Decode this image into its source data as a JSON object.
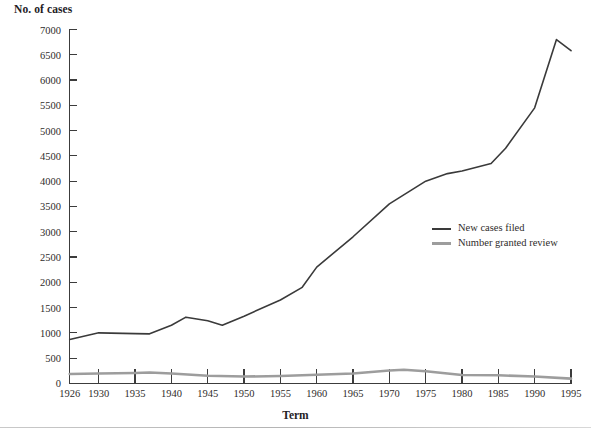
{
  "chart_data": {
    "type": "line",
    "title": "",
    "ylabel": "No. of cases",
    "xlabel": "Term",
    "grid": false,
    "legend_position": "inside-right",
    "xlim": [
      1926,
      1995
    ],
    "ylim": [
      0,
      7000
    ],
    "ytick_step": 500,
    "yticks": [
      7000,
      6500,
      6000,
      5500,
      5000,
      4500,
      4000,
      3500,
      3000,
      2500,
      2000,
      1500,
      1000,
      500,
      0
    ],
    "xticks": [
      1926,
      1930,
      1935,
      1940,
      1945,
      1950,
      1955,
      1960,
      1965,
      1970,
      1975,
      1980,
      1985,
      1990,
      1995
    ],
    "colors": {
      "series_new_cases": "#3a3a3a",
      "series_granted_review": "#9d9d9d",
      "axis": "#3c3c3c",
      "text": "#2f2c2b",
      "background": "#ffffff"
    },
    "series": [
      {
        "name": "New cases filed",
        "color": "#3a3a3a",
        "x": [
          1926,
          1930,
          1935,
          1937,
          1940,
          1942,
          1945,
          1947,
          1950,
          1955,
          1958,
          1960,
          1965,
          1970,
          1975,
          1978,
          1980,
          1984,
          1986,
          1990,
          1993,
          1995
        ],
        "values": [
          870,
          1000,
          985,
          980,
          1150,
          1310,
          1240,
          1150,
          1330,
          1650,
          1900,
          2300,
          2900,
          3550,
          4000,
          4150,
          4200,
          4350,
          4650,
          5450,
          6800,
          6580
        ]
      },
      {
        "name": "Number granted review",
        "color": "#9d9d9d",
        "x": [
          1926,
          1930,
          1935,
          1937,
          1940,
          1945,
          1950,
          1955,
          1960,
          1965,
          1970,
          1972,
          1975,
          1980,
          1985,
          1990,
          1995
        ],
        "values": [
          185,
          195,
          205,
          215,
          195,
          150,
          135,
          145,
          170,
          195,
          255,
          270,
          240,
          165,
          160,
          135,
          95
        ]
      }
    ]
  },
  "legend": {
    "items": [
      {
        "label": "New cases filed"
      },
      {
        "label": "Number granted review"
      }
    ]
  }
}
